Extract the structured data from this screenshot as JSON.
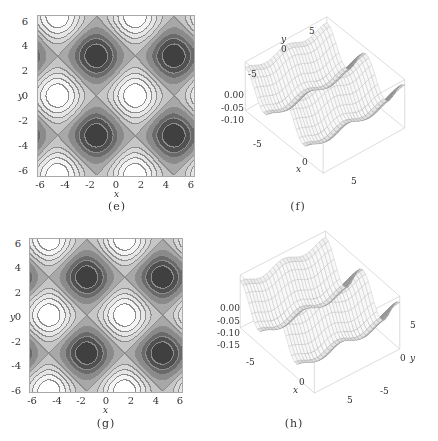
{
  "chart_data": [
    {
      "panel": "e",
      "type": "heatmap",
      "subtype": "contour",
      "caption": "(e)",
      "xlabel": "x",
      "ylabel": "y",
      "xlim": [
        -6.28,
        6.28
      ],
      "ylim": [
        -6.28,
        6.28
      ],
      "xticks": [
        "-6",
        "-4",
        "-2",
        "0",
        "2",
        "4",
        "6"
      ],
      "yticks": [
        "6",
        "4",
        "2",
        "0",
        "-2",
        "-4",
        "-6"
      ],
      "minima": [
        [
          -1.6,
          3.1
        ],
        [
          4.7,
          3.1
        ],
        [
          -1.6,
          -3.3
        ],
        [
          4.7,
          -3.3
        ]
      ],
      "maxima": [
        [
          -4.8,
          0
        ],
        [
          1.6,
          0
        ],
        [
          -4.8,
          6.2
        ],
        [
          1.6,
          6.2
        ],
        [
          -4.8,
          -6.2
        ],
        [
          1.6,
          -6.2
        ]
      ],
      "levels": 10,
      "colormap": [
        "#ffffff",
        "#f4f4f4",
        "#e6e6e6",
        "#d8d8d8",
        "#c6c6c6",
        "#a8a8a8",
        "#8a8a8a",
        "#6a6a6a",
        "#505050",
        "#404040"
      ]
    },
    {
      "panel": "f",
      "type": "area",
      "subtype": "surface3d",
      "caption": "(f)",
      "xlabel": "x",
      "ylabel": "y",
      "xticks": [
        "-5",
        "0",
        "5"
      ],
      "yticks": [
        "5",
        "0",
        "-5"
      ],
      "zticks": [
        "0.00",
        "-0.05",
        "-0.10"
      ],
      "zlim": [
        -0.12,
        0.0
      ]
    },
    {
      "panel": "g",
      "type": "heatmap",
      "subtype": "contour",
      "caption": "(g)",
      "xlabel": "x",
      "ylabel": "y",
      "xlim": [
        -6.28,
        6.28
      ],
      "ylim": [
        -6.28,
        6.28
      ],
      "xticks": [
        "-6",
        "-4",
        "-2",
        "0",
        "2",
        "4",
        "6"
      ],
      "yticks": [
        "6",
        "4",
        "2",
        "0",
        "-2",
        "-4",
        "-6"
      ],
      "minima": [
        [
          -1.6,
          3.1
        ],
        [
          4.7,
          3.1
        ],
        [
          -1.6,
          -3.3
        ],
        [
          4.7,
          -3.3
        ]
      ],
      "maxima": [
        [
          -4.8,
          0
        ],
        [
          1.6,
          0
        ],
        [
          -4.8,
          6.2
        ],
        [
          1.6,
          6.2
        ],
        [
          -4.8,
          -6.2
        ],
        [
          1.6,
          -6.2
        ]
      ],
      "levels": 10,
      "colormap": [
        "#ffffff",
        "#f4f4f4",
        "#e6e6e6",
        "#d8d8d8",
        "#c6c6c6",
        "#a8a8a8",
        "#8a8a8a",
        "#6a6a6a",
        "#505050",
        "#404040"
      ]
    },
    {
      "panel": "h",
      "type": "area",
      "subtype": "surface3d",
      "caption": "(h)",
      "xlabel": "x",
      "ylabel": "y",
      "xticks": [
        "-5",
        "0",
        "5"
      ],
      "yticks": [
        "5",
        "0",
        "-5"
      ],
      "zticks": [
        "0.00",
        "-0.05",
        "-0.10",
        "-0.15"
      ],
      "zlim": [
        -0.17,
        0.0
      ]
    }
  ]
}
